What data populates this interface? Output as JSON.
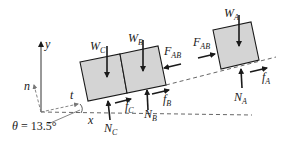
{
  "diagram": {
    "colors": {
      "block_fill": "#d4d4d4",
      "stroke": "#1a1a1a",
      "dashed": "#555555"
    },
    "axes": {
      "x_label": "x",
      "y_label": "y",
      "n_label": "n",
      "t_label": "t",
      "angle_label": "θ = 13.5°",
      "angle_value_deg": 13.5
    },
    "blocks": [
      {
        "id": "C",
        "weight": {
          "sym": "W",
          "sub": "C"
        },
        "normal": {
          "sym": "N",
          "sub": "C"
        },
        "friction": {
          "sym": "f",
          "sub": "C"
        }
      },
      {
        "id": "B",
        "weight": {
          "sym": "W",
          "sub": "B"
        },
        "normal": {
          "sym": "N",
          "sub": "B"
        },
        "friction": {
          "sym": "f",
          "sub": "B"
        },
        "contact": {
          "sym": "F",
          "sub": "AB"
        }
      },
      {
        "id": "A",
        "weight": {
          "sym": "W",
          "sub": "A"
        },
        "normal": {
          "sym": "N",
          "sub": "A"
        },
        "friction": {
          "sym": "f",
          "sub": "A"
        },
        "contact": {
          "sym": "F",
          "sub": "AB"
        }
      }
    ]
  }
}
